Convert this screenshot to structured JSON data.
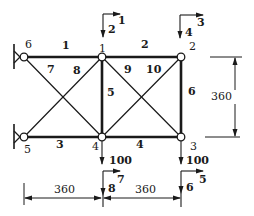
{
  "diagram": {
    "type": "10-bar planar truss",
    "nodes": [
      {
        "id": "1",
        "x": 102,
        "y": 57
      },
      {
        "id": "2",
        "x": 181,
        "y": 57
      },
      {
        "id": "3",
        "x": 181,
        "y": 137
      },
      {
        "id": "4",
        "x": 102,
        "y": 137
      },
      {
        "id": "5",
        "x": 24,
        "y": 137
      },
      {
        "id": "6",
        "x": 24,
        "y": 57
      }
    ],
    "members": [
      {
        "id": "1",
        "from": "6",
        "to": "1"
      },
      {
        "id": "2",
        "from": "1",
        "to": "2"
      },
      {
        "id": "3",
        "from": "5",
        "to": "4"
      },
      {
        "id": "4",
        "from": "4",
        "to": "3"
      },
      {
        "id": "5",
        "from": "1",
        "to": "4"
      },
      {
        "id": "6",
        "from": "2",
        "to": "3"
      },
      {
        "id": "7",
        "from": "6",
        "to": "4"
      },
      {
        "id": "8",
        "from": "5",
        "to": "1"
      },
      {
        "id": "9",
        "from": "1",
        "to": "3"
      },
      {
        "id": "10",
        "from": "4",
        "to": "2"
      }
    ],
    "supports": [
      {
        "node": "6",
        "type": "pin"
      },
      {
        "node": "5",
        "type": "pin"
      }
    ],
    "loads": [
      {
        "node": "4",
        "value": "100",
        "direction": "down"
      },
      {
        "node": "3",
        "value": "100",
        "direction": "down"
      }
    ],
    "dof_labels": [
      {
        "node": "1",
        "x_dof": "1",
        "y_dof": "2"
      },
      {
        "node": "2",
        "x_dof": "3",
        "y_dof": "4"
      },
      {
        "node": "3",
        "x_dof": "5",
        "y_dof": "6"
      },
      {
        "node": "4",
        "x_dof": "7",
        "y_dof": "8"
      }
    ],
    "dimensions": {
      "bay_left": "360",
      "bay_right": "360",
      "height": "360"
    }
  }
}
